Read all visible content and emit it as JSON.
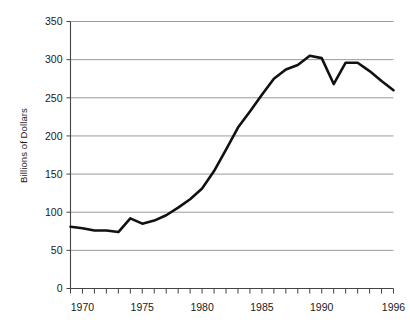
{
  "chart_data": {
    "type": "line",
    "title": "",
    "xlabel": "",
    "ylabel": "Billions of Dollars",
    "xlim": [
      1969,
      1996
    ],
    "ylim": [
      0,
      350
    ],
    "grid": true,
    "legend": "none",
    "x_tick_labels": [
      "1970",
      "1975",
      "1980",
      "1985",
      "1990",
      "1996"
    ],
    "x_tick_values": [
      1970,
      1975,
      1980,
      1985,
      1990,
      1996
    ],
    "x_minor_ticks_every": 1,
    "y_tick_labels": [
      "0",
      "50",
      "100",
      "150",
      "200",
      "250",
      "300",
      "350"
    ],
    "y_tick_values": [
      0,
      50,
      100,
      150,
      200,
      250,
      300,
      350
    ],
    "line_color": "#111111",
    "line_width": 2.6,
    "grid_color": "#9a9a9a",
    "axis_color": "#444444",
    "background": "#ffffff",
    "x": [
      1969,
      1970,
      1971,
      1972,
      1973,
      1974,
      1975,
      1976,
      1977,
      1978,
      1979,
      1980,
      1981,
      1982,
      1983,
      1984,
      1985,
      1986,
      1987,
      1988,
      1989,
      1990,
      1991,
      1992,
      1993,
      1994,
      1995,
      1996
    ],
    "values": [
      81,
      79,
      76,
      76,
      74,
      92,
      85,
      89,
      96,
      106,
      117,
      131,
      154,
      182,
      211,
      232,
      254,
      275,
      287,
      293,
      305,
      302,
      268,
      296,
      296,
      285,
      272,
      260
    ],
    "series": [
      {
        "name": "Billions of Dollars",
        "values": [
          81,
          79,
          76,
          76,
          74,
          92,
          85,
          89,
          96,
          106,
          117,
          131,
          154,
          182,
          211,
          232,
          254,
          275,
          287,
          293,
          305,
          302,
          268,
          296,
          296,
          285,
          272,
          260
        ]
      }
    ]
  }
}
